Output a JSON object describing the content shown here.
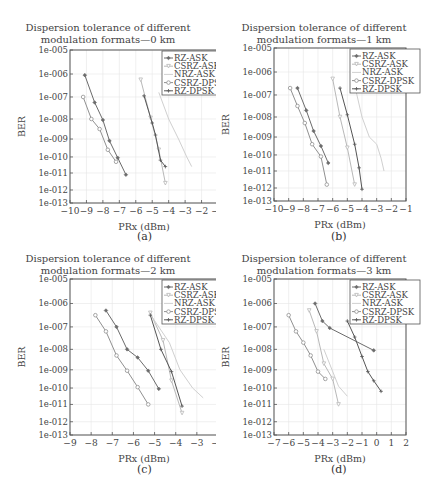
{
  "legend_labels": [
    "RZ-ASK",
    "CSRZ-ASK",
    "NRZ-ASK",
    "CSRZ-DPSK",
    "RZ-DPSK"
  ],
  "series_styles": [
    {
      "name": "RZ-ASK",
      "color": "#6b6b6b",
      "marker": "diamond"
    },
    {
      "name": "CSRZ-ASK",
      "color": "#b8b8b8",
      "marker": "triangle"
    },
    {
      "name": "NRZ-ASK",
      "color": "#d0d0d0",
      "marker": "none"
    },
    {
      "name": "CSRZ-DPSK",
      "color": "#909090",
      "marker": "circle"
    },
    {
      "name": "RZ-DPSK",
      "color": "#555555",
      "marker": "plus"
    }
  ],
  "y_ticks": [
    "1e-005",
    "1e-006",
    "1e-007",
    "1e-008",
    "1e-009",
    "1e-010",
    "1e-011",
    "1e-012",
    "1e-013"
  ],
  "y_tick_exponents": [
    -5,
    -6,
    -7,
    -8,
    -9,
    -10,
    -11,
    -12,
    -13
  ],
  "y_tick_fractions": [
    0,
    0.157,
    0.307,
    0.451,
    0.582,
    0.699,
    0.804,
    0.915,
    1.0
  ],
  "chart_data": [
    {
      "panel": "a",
      "caption": "(a)",
      "type": "line",
      "title": "Dispersion tolerance of different modulation formats—0 km",
      "title_line1": "Dispersion tolerance of different",
      "title_line2": "modulation formats—0 km",
      "xlabel": "PRx (dBm)",
      "ylabel": "BER",
      "y_scale": "log",
      "xlim": [
        -10,
        -1
      ],
      "ylim": [
        1e-13,
        1e-05
      ],
      "x_ticks": [
        -10,
        -9,
        -8,
        -7,
        -6,
        -5,
        -4,
        -3,
        -2,
        -1
      ],
      "legend_position": "upper right",
      "grid": true,
      "series": [
        {
          "name": "RZ-ASK",
          "x": [
            -9.1,
            -8.5,
            -8.0,
            -7.6,
            -7.1,
            -6.6
          ],
          "log10_ber": [
            -6.05,
            -7.25,
            -8.05,
            -9.1,
            -10.05,
            -11.1
          ]
        },
        {
          "name": "CSRZ-ASK",
          "x": [
            -5.7,
            -5.1,
            -4.6,
            -4.2
          ],
          "log10_ber": [
            -6.25,
            -7.95,
            -9.6,
            -11.6
          ]
        },
        {
          "name": "NRZ-ASK",
          "x": [
            -4.6,
            -4.0,
            -3.4,
            -2.9,
            -2.6
          ],
          "log10_ber": [
            -6.8,
            -8.0,
            -9.0,
            -10.0,
            -10.6
          ]
        },
        {
          "name": "CSRZ-DPSK",
          "x": [
            -9.2,
            -8.7,
            -8.2,
            -7.7,
            -7.2
          ],
          "log10_ber": [
            -7.0,
            -8.0,
            -8.5,
            -9.6,
            -10.3
          ]
        },
        {
          "name": "RZ-DPSK",
          "x": [
            -5.5,
            -5.0,
            -4.8,
            -4.5,
            -4.2
          ],
          "log10_ber": [
            -6.95,
            -8.2,
            -8.8,
            -10.2,
            -10.6
          ]
        }
      ]
    },
    {
      "panel": "b",
      "caption": "(b)",
      "type": "line",
      "title": "Dispersion tolerance of different modulation formats—1 km",
      "title_line1": "Dispersion tolerance of different",
      "title_line2": "modulation formats—1 km",
      "xlabel": "PRx (dBm)",
      "ylabel": "BER",
      "y_scale": "log",
      "xlim": [
        -10,
        -1
      ],
      "ylim": [
        1e-13,
        1e-05
      ],
      "x_ticks": [
        -10,
        -9,
        -8,
        -7,
        -6,
        -5,
        -4,
        -3,
        -2,
        -1
      ],
      "legend_position": "upper right",
      "grid": true,
      "series": [
        {
          "name": "RZ-ASK",
          "x": [
            -8.4,
            -7.8,
            -7.3,
            -6.8,
            -6.3
          ],
          "log10_ber": [
            -6.7,
            -7.7,
            -8.7,
            -9.5,
            -10.5
          ]
        },
        {
          "name": "CSRZ-ASK",
          "x": [
            -6.0,
            -5.5,
            -5.0,
            -4.5
          ],
          "log10_ber": [
            -6.3,
            -8.0,
            -9.6,
            -11.8
          ]
        },
        {
          "name": "NRZ-ASK",
          "x": [
            -4.6,
            -4.0,
            -3.5,
            -3.0,
            -2.7,
            -2.5
          ],
          "log10_ber": [
            -6.3,
            -8.0,
            -9.0,
            -9.4,
            -10.2,
            -11.0
          ]
        },
        {
          "name": "CSRZ-DPSK",
          "x": [
            -8.9,
            -8.4,
            -7.9,
            -7.4,
            -6.8,
            -6.4
          ],
          "log10_ber": [
            -6.7,
            -7.5,
            -8.3,
            -9.4,
            -10.1,
            -11.8
          ]
        },
        {
          "name": "RZ-DPSK",
          "x": [
            -5.5,
            -5.0,
            -4.5,
            -4.2,
            -4.0
          ],
          "log10_ber": [
            -6.7,
            -7.9,
            -9.4,
            -10.8,
            -12.1
          ]
        }
      ]
    },
    {
      "panel": "c",
      "caption": "(c)",
      "type": "line",
      "title": "Dispersion tolerance of different modulation formats—2 km",
      "title_line1": "Dispersion tolerance of different",
      "title_line2": "modulation formats—2 km",
      "xlabel": "PRx (dBm)",
      "ylabel": "BER",
      "y_scale": "log",
      "xlim": [
        -9,
        -2
      ],
      "ylim": [
        1e-13,
        1e-05
      ],
      "x_ticks": [
        -9,
        -8,
        -7,
        -6,
        -5,
        -4,
        -3,
        -2
      ],
      "legend_position": "upper right",
      "grid": true,
      "series": [
        {
          "name": "RZ-ASK",
          "x": [
            -7.3,
            -6.8,
            -6.3,
            -5.8,
            -5.3,
            -4.8
          ],
          "log10_ber": [
            -6.3,
            -7.0,
            -8.0,
            -8.4,
            -9.05,
            -10.05
          ]
        },
        {
          "name": "CSRZ-ASK",
          "x": [
            -5.2,
            -4.6,
            -4.2,
            -3.7
          ],
          "log10_ber": [
            -6.4,
            -7.6,
            -9.6,
            -11.5
          ]
        },
        {
          "name": "NRZ-ASK",
          "x": [
            -5.1,
            -4.3,
            -3.8,
            -3.2,
            -2.7
          ],
          "log10_ber": [
            -6.6,
            -7.7,
            -9.0,
            -10.0,
            -10.6
          ]
        },
        {
          "name": "CSRZ-DPSK",
          "x": [
            -7.8,
            -7.3,
            -6.8,
            -6.3,
            -5.8,
            -5.3
          ],
          "log10_ber": [
            -6.5,
            -7.2,
            -8.3,
            -9.05,
            -9.95,
            -11.0
          ]
        },
        {
          "name": "RZ-DPSK",
          "x": [
            -5.2,
            -4.7,
            -4.2,
            -3.7
          ],
          "log10_ber": [
            -6.5,
            -8.0,
            -9.1,
            -11.1
          ]
        }
      ]
    },
    {
      "panel": "d",
      "caption": "(d)",
      "type": "line",
      "title": "Dispersion tolerance of different modulation formats—3 km",
      "title_line1": "Dispersion tolerance of different",
      "title_line2": "modulation formats—3 km",
      "xlabel": "PRx (dBm)",
      "ylabel": "BER",
      "y_scale": "log",
      "xlim": [
        -7,
        2
      ],
      "ylim": [
        1e-13,
        1e-05
      ],
      "x_ticks": [
        -7,
        -6,
        -5,
        -4,
        -3,
        -2,
        -1,
        0,
        1,
        2
      ],
      "legend_position": "upper right",
      "grid": true,
      "series": [
        {
          "name": "RZ-ASK",
          "x": [
            -4.2,
            -3.7,
            -3.2,
            -0.2
          ],
          "log10_ber": [
            -6.0,
            -6.75,
            -7.05,
            -8.05
          ]
        },
        {
          "name": "CSRZ-ASK",
          "x": [
            -4.6,
            -4.1,
            -3.6,
            -3.0,
            -2.6
          ],
          "log10_ber": [
            -6.3,
            -7.2,
            -8.7,
            -9.5,
            -11.0
          ]
        },
        {
          "name": "NRZ-ASK",
          "x": [
            -3.6,
            -2.6,
            -2.0
          ],
          "log10_ber": [
            -8.0,
            -9.9,
            -10.5
          ]
        },
        {
          "name": "CSRZ-DPSK",
          "x": [
            -6.0,
            -5.5,
            -5.0,
            -4.5,
            -4.0,
            -3.5
          ],
          "log10_ber": [
            -6.5,
            -7.2,
            -7.7,
            -8.3,
            -9.1,
            -9.5
          ]
        },
        {
          "name": "RZ-DPSK",
          "x": [
            -2.0,
            -1.5,
            -1.0,
            -0.6,
            -0.2,
            0.3
          ],
          "log10_ber": [
            -6.75,
            -7.45,
            -8.35,
            -9.1,
            -9.6,
            -10.2
          ]
        }
      ]
    }
  ]
}
